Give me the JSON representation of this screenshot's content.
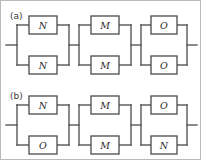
{
  "figure": {
    "type": "block-diagram",
    "line_color": "#4a4a4a",
    "box_fill": "#ffffff",
    "background": "#ffffff",
    "border_color": "#b9b9b9"
  },
  "panels": [
    {
      "label": "(a)",
      "blocks": [
        {
          "top": "N",
          "bottom": "N"
        },
        {
          "top": "M",
          "bottom": "M"
        },
        {
          "top": "O",
          "bottom": "O"
        }
      ]
    },
    {
      "label": "(b)",
      "blocks": [
        {
          "top": "N",
          "bottom": "O"
        },
        {
          "top": "M",
          "bottom": "M"
        },
        {
          "top": "O",
          "bottom": "N"
        }
      ]
    }
  ]
}
